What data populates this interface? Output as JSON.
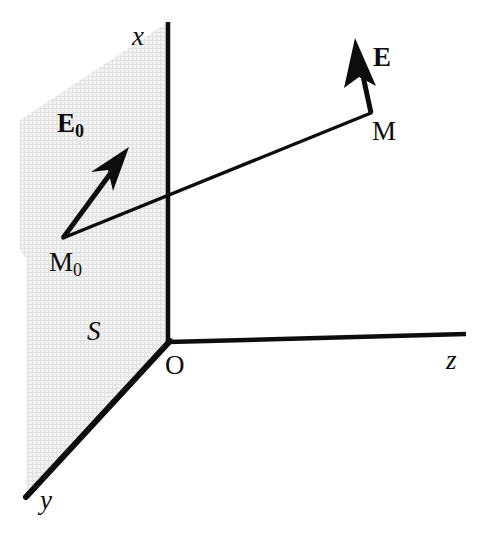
{
  "figure": {
    "kind": "3d-coordinate-axes-diagram",
    "background_color": "#ffffff",
    "ink_color": "#0d0d0d",
    "plane_fill_color": "#ececec",
    "axes": {
      "x": {
        "label": "x",
        "label_x": 132,
        "label_y": 23,
        "style": "italic-serif"
      },
      "y": {
        "label": "y",
        "label_x": 40,
        "label_y": 487,
        "style": "italic-serif"
      },
      "z": {
        "label": "z",
        "label_x": 446,
        "label_y": 347,
        "style": "italic-serif"
      }
    },
    "origin": {
      "label": "O",
      "label_x": 165,
      "label_y": 352
    },
    "plane": {
      "label": "S",
      "label_x": 87,
      "label_y": 318
    },
    "points": [
      {
        "name": "M0",
        "label": "M",
        "sublabel": "0",
        "label_x": 49,
        "label_y": 249
      },
      {
        "name": "M",
        "label": "M",
        "sublabel": "",
        "label_x": 372,
        "label_y": 118
      }
    ],
    "vectors": [
      {
        "name": "E0",
        "label": "E",
        "sublabel": "0",
        "label_x": 57,
        "label_y": 110
      },
      {
        "name": "E",
        "label": "E",
        "sublabel": "",
        "label_x": 373,
        "label_y": 44
      }
    ]
  },
  "geometry": {
    "origin": {
      "x": 168,
      "y": 342
    },
    "x_axis": {
      "x1": 168,
      "y1": 342,
      "x2": 168,
      "y2": 22
    },
    "z_axis": {
      "x1": 168,
      "y1": 342,
      "x2": 466,
      "y2": 334
    },
    "y_axis": {
      "x1": 168,
      "y1": 342,
      "x2": 26,
      "y2": 497
    },
    "plane_polygon": "168,22 168,342 26,497 26,258 20,250 20,120",
    "ray_M0_to_M": {
      "x1": 63,
      "y1": 238,
      "x2": 371,
      "y2": 113
    },
    "vector_E0": {
      "x1": 63,
      "y1": 238,
      "x2": 127,
      "y2": 150
    },
    "vector_E": {
      "x1": 371,
      "y1": 113,
      "x2": 355,
      "y2": 40
    }
  }
}
